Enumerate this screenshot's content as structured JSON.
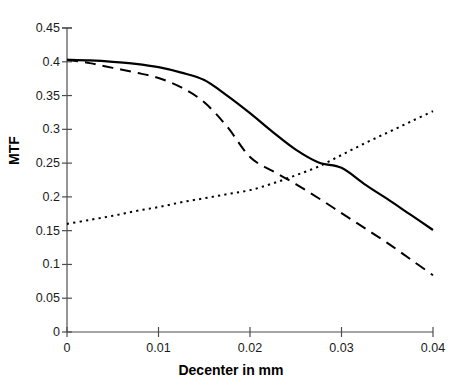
{
  "chart_data": {
    "type": "line",
    "title": "",
    "subtitle": "",
    "xlabel": "Decenter in mm",
    "ylabel": "MTF",
    "xlim": [
      0,
      0.04
    ],
    "ylim": [
      0,
      0.45
    ],
    "grid": false,
    "legend": "none",
    "background_color": "#ffffff",
    "line_color": "#000000",
    "x_ticks": [
      0,
      0.01,
      0.02,
      0.03,
      0.04
    ],
    "x_tick_labels": [
      "0",
      "0.01",
      "0.02",
      "0.03",
      "0.04"
    ],
    "y_ticks": [
      0,
      0.05,
      0.1,
      0.15,
      0.2,
      0.25,
      0.3,
      0.35,
      0.4,
      0.45
    ],
    "y_tick_labels": [
      "0",
      "0.05",
      "0.1",
      "0.15",
      "0.2",
      "0.25",
      "0.3",
      "0.35",
      "0.4",
      "0.45"
    ],
    "x": [
      0,
      0.0025,
      0.005,
      0.0075,
      0.01,
      0.0125,
      0.015,
      0.0175,
      0.02,
      0.0225,
      0.025,
      0.0275,
      0.03,
      0.0325,
      0.035,
      0.0375,
      0.04
    ],
    "series": [
      {
        "name": "solid-curve",
        "style": "solid",
        "color": "#000000",
        "values": [
          0.403,
          0.402,
          0.4,
          0.397,
          0.392,
          0.384,
          0.373,
          0.35,
          0.324,
          0.296,
          0.27,
          0.251,
          0.243,
          0.219,
          0.197,
          0.174,
          0.151
        ]
      },
      {
        "name": "dashed-curve",
        "style": "dashed",
        "color": "#000000",
        "values": [
          0.403,
          0.398,
          0.391,
          0.384,
          0.376,
          0.362,
          0.34,
          0.304,
          0.259,
          0.238,
          0.219,
          0.198,
          0.176,
          0.154,
          0.132,
          0.108,
          0.084
        ]
      },
      {
        "name": "dotted-curve",
        "style": "dotted",
        "color": "#000000",
        "values": [
          0.16,
          0.166,
          0.172,
          0.179,
          0.185,
          0.192,
          0.198,
          0.204,
          0.21,
          0.22,
          0.232,
          0.245,
          0.262,
          0.279,
          0.295,
          0.311,
          0.327
        ]
      }
    ]
  },
  "axes": {
    "y_title": "MTF",
    "x_title": "Decenter in mm"
  }
}
